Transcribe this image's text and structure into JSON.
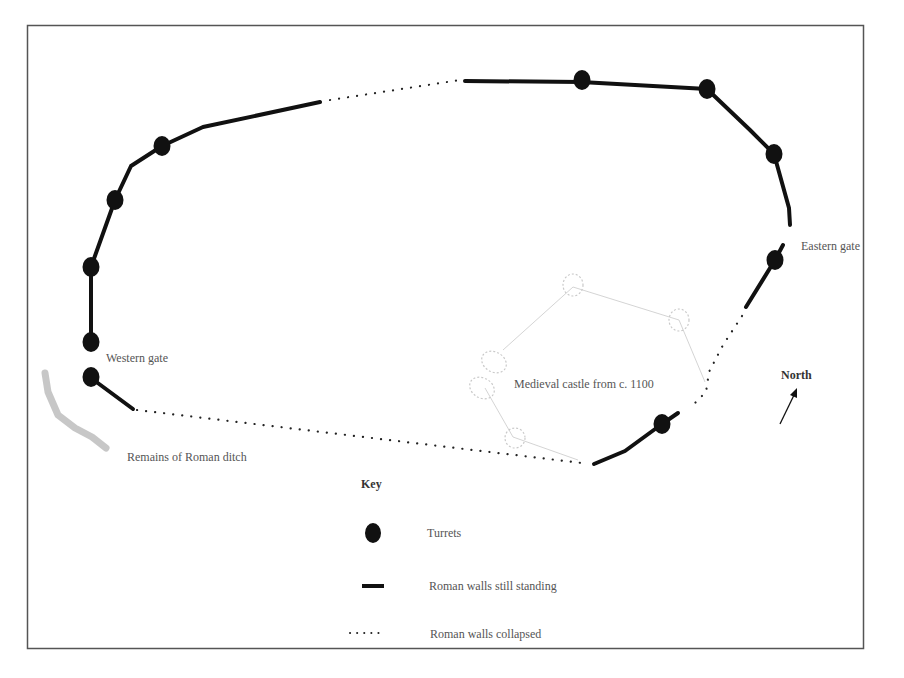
{
  "diagram": {
    "type": "map",
    "labels": {
      "western_gate": "Western gate",
      "eastern_gate": "Eastern gate",
      "roman_ditch": "Remains of Roman ditch",
      "medieval_castle": "Medieval castle from c. 1100",
      "north": "North"
    },
    "key": {
      "title": "Key",
      "items": [
        {
          "symbol": "turret-dot",
          "label": "Turrets"
        },
        {
          "symbol": "solid-line",
          "label": "Roman walls still standing"
        },
        {
          "symbol": "dotted-line",
          "label": "Roman walls collapsed"
        }
      ]
    },
    "colors": {
      "wall": "#111111",
      "ditch": "#b8b8b8",
      "castle_outline": "#c8c8c8",
      "frame": "#555555",
      "label_text": "#555555"
    }
  }
}
